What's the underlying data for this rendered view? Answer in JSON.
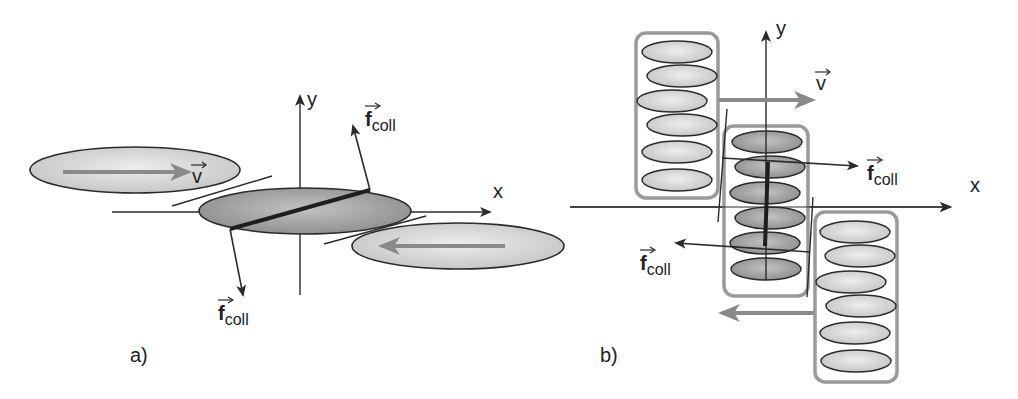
{
  "colors": {
    "background": "#ffffff",
    "line": "#2a2a2a",
    "gray_arrow": "#8a8a8a",
    "box_stroke": "#9a9a9a",
    "ellipse_light": "#dcdcdc",
    "ellipse_dark": "#a8a8a8"
  },
  "panel_a": {
    "label": "a)",
    "label_pos": [
      130,
      362
    ],
    "x_axis": {
      "label": "x",
      "from": [
        112,
        212
      ],
      "to": [
        490,
        212
      ],
      "label_pos": [
        493,
        198
      ]
    },
    "y_axis": {
      "label": "y",
      "from": [
        300,
        295
      ],
      "to": [
        300,
        96
      ],
      "label_pos": [
        307,
        106
      ]
    },
    "ellipses": [
      {
        "name": "left-particle",
        "cx": 135,
        "cy": 170,
        "rx": 105,
        "ry": 23,
        "shade": "light"
      },
      {
        "name": "center-particle",
        "cx": 305,
        "cy": 211,
        "rx": 106,
        "ry": 23,
        "shade": "dark"
      },
      {
        "name": "right-particle",
        "cx": 458,
        "cy": 246,
        "rx": 106,
        "ry": 23,
        "shade": "light"
      }
    ],
    "velocity_arrows": [
      {
        "from": [
          63,
          172
        ],
        "to": [
          188,
          172
        ]
      },
      {
        "from": [
          505,
          246
        ],
        "to": [
          382,
          246
        ]
      }
    ],
    "velocity_label": {
      "text": "v",
      "pos": [
        192,
        183
      ]
    },
    "tangent_lines": [
      {
        "from": [
          172,
          206
        ],
        "to": [
          272,
          176
        ]
      },
      {
        "from": [
          324,
          244
        ],
        "to": [
          426,
          216
        ]
      }
    ],
    "contact_line": {
      "from": [
        230,
        229
      ],
      "to": [
        370,
        190
      ]
    },
    "force_arrows": [
      {
        "from": [
          230,
          229
        ],
        "to": [
          243,
          295
        ]
      },
      {
        "from": [
          370,
          190
        ],
        "to": [
          353,
          126
        ]
      }
    ],
    "force_labels": [
      {
        "main": "f",
        "sub": "coll",
        "pos": [
          365,
          126
        ]
      },
      {
        "main": "f",
        "sub": "coll",
        "pos": [
          218,
          320
        ]
      }
    ]
  },
  "panel_b": {
    "label": "b)",
    "label_pos": [
      600,
      362
    ],
    "x_axis": {
      "label": "x",
      "from": [
        570,
        207
      ],
      "to": [
        950,
        207
      ],
      "label_pos": [
        970,
        192
      ]
    },
    "y_axis": {
      "label": "y",
      "from": [
        766,
        280
      ],
      "to": [
        766,
        32
      ],
      "label_pos": [
        776,
        35
      ]
    },
    "boxes": [
      {
        "name": "upper-left-cluster",
        "x": 636,
        "y": 33,
        "w": 82,
        "h": 165,
        "shade": "light",
        "ellipses": [
          [
            677,
            52
          ],
          [
            682,
            76
          ],
          [
            672,
            101
          ],
          [
            682,
            125
          ],
          [
            677,
            152
          ],
          [
            677,
            180
          ]
        ]
      },
      {
        "name": "middle-cluster",
        "x": 724,
        "y": 126,
        "w": 84,
        "h": 170,
        "shade": "dark",
        "ellipses": [
          [
            767,
            142
          ],
          [
            770,
            167
          ],
          [
            765,
            193
          ],
          [
            770,
            218
          ],
          [
            765,
            243
          ],
          [
            766,
            269
          ]
        ]
      },
      {
        "name": "lower-right-cluster",
        "x": 815,
        "y": 212,
        "w": 82,
        "h": 170,
        "shade": "light",
        "ellipses": [
          [
            855,
            232
          ],
          [
            860,
            256
          ],
          [
            851,
            282
          ],
          [
            861,
            306
          ],
          [
            855,
            333
          ],
          [
            856,
            361
          ]
        ]
      }
    ],
    "ellipse_rx": 35,
    "ellipse_ry": 11,
    "velocity_arrows": [
      {
        "from": [
          719,
          100
        ],
        "to": [
          812,
          100
        ]
      },
      {
        "from": [
          814,
          313
        ],
        "to": [
          722,
          313
        ]
      }
    ],
    "velocity_label": {
      "text": "v",
      "pos": [
        816,
        90
      ]
    },
    "tangent_lines": [
      {
        "from": [
          727,
          109
        ],
        "to": [
          718,
          222
        ]
      },
      {
        "from": [
          813,
          197
        ],
        "to": [
          807,
          297
        ]
      }
    ],
    "contact_line": {
      "from": [
        768,
        162
      ],
      "to": [
        765,
        246
      ]
    },
    "force_arrows": [
      {
        "from": [
          722,
          158
        ],
        "to": [
          857,
          166
        ]
      },
      {
        "from": [
          810,
          252
        ],
        "to": [
          676,
          243
        ]
      }
    ],
    "force_labels": [
      {
        "main": "f",
        "sub": "coll",
        "pos": [
          867,
          180
        ]
      },
      {
        "main": "f",
        "sub": "coll",
        "pos": [
          640,
          270
        ]
      }
    ]
  }
}
